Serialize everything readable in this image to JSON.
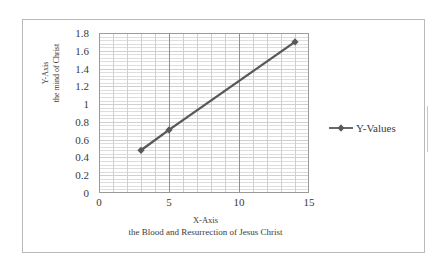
{
  "chart_data": {
    "type": "line",
    "title": "",
    "series": [
      {
        "name": "Y-Values",
        "marker": "diamond",
        "color": "#595959",
        "points": [
          {
            "x": 3,
            "y": 0.48
          },
          {
            "x": 5,
            "y": 0.71
          },
          {
            "x": 14,
            "y": 1.7
          }
        ]
      }
    ],
    "xlabel": "X-Axis",
    "xlabel_sub": "the Blood and Resurrection of Jesus Christ",
    "ylabel": "Y-Axis",
    "ylabel_sub": "the mind of Christ",
    "xlim": [
      0,
      15
    ],
    "ylim": [
      0,
      1.8
    ],
    "x_ticks": [
      "0",
      "5",
      "10",
      "15"
    ],
    "x_tick_values": [
      0,
      5,
      10,
      15
    ],
    "y_ticks": [
      "0",
      "0.2",
      "0.4",
      "0.6",
      "0.8",
      "1",
      "1.2",
      "1.4",
      "1.6",
      "1.8"
    ],
    "y_tick_values": [
      0,
      0.2,
      0.4,
      0.6,
      0.8,
      1,
      1.2,
      1.4,
      1.6,
      1.8
    ],
    "grid": {
      "x_major_step": 5,
      "x_minor_step": 1,
      "y_major_step": 0.2,
      "y_minor_step": 0.04,
      "enabled": true,
      "color": "#cfcfcf",
      "minor_color": "#dddddd"
    },
    "legend": {
      "position": "right",
      "entries": [
        "Y-Values"
      ]
    },
    "plot_border_color": "#9a9a9a",
    "frame_border_color": "#b9b9b9"
  },
  "legend": {
    "label": "Y-Values"
  },
  "axes": {
    "y_title_line1": "Y-Axis",
    "y_title_line2": "the mind of Christ",
    "x_title_line1": "X-Axis",
    "x_title_line2": "the Blood and Resurrection of Jesus Christ"
  }
}
